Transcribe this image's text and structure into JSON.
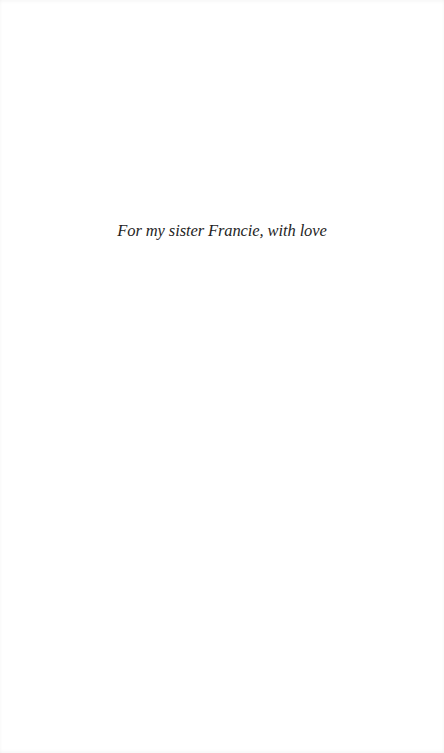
{
  "page": {
    "background_color": "#ffffff",
    "text_color": "#1f1f1f"
  },
  "dedication": {
    "text": "For my sister Francie, with love"
  }
}
